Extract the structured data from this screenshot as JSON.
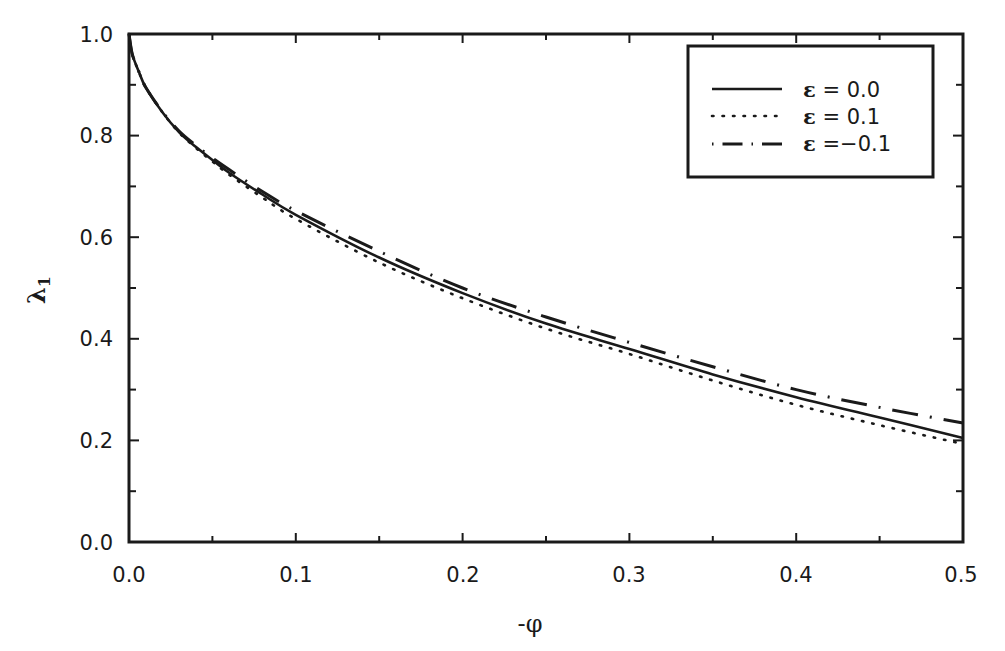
{
  "chart_data": {
    "type": "line",
    "title": "",
    "xlabel": "-φ",
    "ylabel": "λ₁",
    "xlim": [
      0.0,
      0.5
    ],
    "ylim": [
      0.0,
      1.0
    ],
    "grid": false,
    "legend_position": "upper right",
    "x_ticks": [
      "0.0",
      "0.1",
      "0.2",
      "0.3",
      "0.4",
      "0.5"
    ],
    "y_ticks": [
      "0.0",
      "0.2",
      "0.4",
      "0.6",
      "0.8",
      "1.0"
    ],
    "x": [
      0.0,
      0.002,
      0.006,
      0.01,
      0.02,
      0.03,
      0.04,
      0.05,
      0.06,
      0.08,
      0.1,
      0.15,
      0.2,
      0.25,
      0.3,
      0.35,
      0.4,
      0.45,
      0.5
    ],
    "series": [
      {
        "name": "ε = 0.0",
        "style": "solid",
        "values": [
          1.0,
          0.96,
          0.925,
          0.895,
          0.846,
          0.807,
          0.778,
          0.752,
          0.727,
          0.684,
          0.644,
          0.56,
          0.49,
          0.43,
          0.38,
          0.33,
          0.285,
          0.245,
          0.205
        ]
      },
      {
        "name": "ε = 0.1",
        "style": "dotted",
        "values": [
          1.0,
          0.96,
          0.925,
          0.895,
          0.846,
          0.806,
          0.776,
          0.749,
          0.723,
          0.678,
          0.636,
          0.55,
          0.48,
          0.42,
          0.37,
          0.318,
          0.27,
          0.23,
          0.193
        ]
      },
      {
        "name": "ε = -0.1",
        "style": "dashdot",
        "values": [
          1.0,
          0.96,
          0.925,
          0.895,
          0.847,
          0.809,
          0.781,
          0.756,
          0.733,
          0.69,
          0.652,
          0.572,
          0.5,
          0.443,
          0.393,
          0.345,
          0.3,
          0.265,
          0.234
        ]
      }
    ]
  },
  "legend": {
    "items": [
      {
        "symbol": "ε",
        "text": " = 0.0"
      },
      {
        "symbol": "ε",
        "text": " = 0.1"
      },
      {
        "symbol": "ε",
        "text": " =−0.1"
      }
    ]
  },
  "axes": {
    "xlabel": "-φ",
    "ylabel_main": "λ",
    "ylabel_sub": "1",
    "x_tick_labels": [
      "0.0",
      "0.1",
      "0.2",
      "0.3",
      "0.4",
      "0.5"
    ],
    "y_tick_labels": [
      "0.0",
      "0.2",
      "0.4",
      "0.6",
      "0.8",
      "1.0"
    ]
  }
}
